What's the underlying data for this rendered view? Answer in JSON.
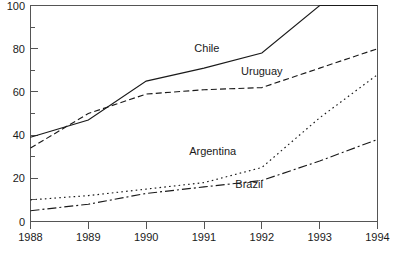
{
  "chart_data": {
    "type": "line",
    "title": "",
    "subtitle": "",
    "xlabel": "",
    "ylabel": "",
    "x": [
      1988,
      1989,
      1990,
      1991,
      1992,
      1993,
      1994
    ],
    "xtick_labels": [
      "1988",
      "1989",
      "1990",
      "1991",
      "1992",
      "1993",
      "1994"
    ],
    "ytick_labels": [
      "0",
      "20",
      "40",
      "60",
      "80",
      "100"
    ],
    "ytick_values": [
      0,
      20,
      40,
      60,
      80,
      100
    ],
    "yminor_values": [
      10,
      30,
      50,
      70,
      90
    ],
    "xlim": [
      1988,
      1994
    ],
    "ylim": [
      0,
      100
    ],
    "grid": false,
    "legend": "inline-annotations",
    "frame": "box",
    "series": [
      {
        "name": "Chile",
        "style": "solid",
        "color": "#1a1a1a",
        "values": [
          39,
          47,
          65,
          71,
          78,
          100,
          100
        ],
        "label": "Chile",
        "label_x": 1991.05,
        "label_y": 78.5
      },
      {
        "name": "Uruguay",
        "style": "dashed",
        "color": "#1a1a1a",
        "values": [
          34,
          50,
          59,
          61,
          62,
          71,
          80
        ],
        "label": "Uruguay",
        "label_x": 1992.0,
        "label_y": 68.0
      },
      {
        "name": "Argentina",
        "style": "dotted",
        "color": "#1a1a1a",
        "values": [
          10,
          12,
          15,
          18,
          25,
          48,
          68
        ],
        "label": "Argentina",
        "label_x": 1991.15,
        "label_y": 31.0
      },
      {
        "name": "Brazil",
        "style": "dashdot",
        "color": "#1a1a1a",
        "values": [
          5,
          8,
          13,
          16,
          19,
          28,
          38
        ],
        "label": "Brazil",
        "label_x": 1991.78,
        "label_y": 15.5
      }
    ]
  },
  "axes": {
    "y_top_label": "100",
    "y_bottom_label": "0",
    "x_first_label": "1988",
    "x_last_label": "1994"
  }
}
